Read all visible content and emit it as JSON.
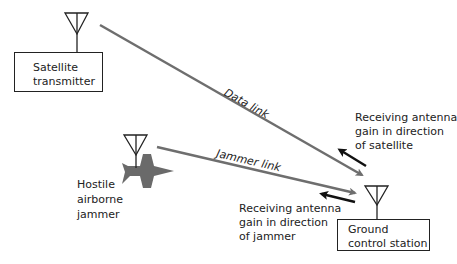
{
  "diagram": {
    "nodes": {
      "satellite": {
        "line1": "Satellite",
        "line2": "transmitter"
      },
      "ground": {
        "line1": "Ground",
        "line2": "control station"
      },
      "jammer": {
        "line1": "Hostile",
        "line2": "airborne",
        "line3": "jammer"
      }
    },
    "links": {
      "data": "Data link",
      "jammer": "Jammer link"
    },
    "annotations": {
      "satellite_gain": {
        "line1": "Receiving antenna",
        "line2": "gain in direction",
        "line3": "of satellite"
      },
      "jammer_gain": {
        "line1": "Receiving antenna",
        "line2": "gain in direction",
        "line3": "of jammer"
      }
    },
    "colors": {
      "link": "#6e6e6e",
      "gain_arrow": "#111111",
      "aircraft": "#6a6a6a",
      "outline": "#222222"
    }
  }
}
